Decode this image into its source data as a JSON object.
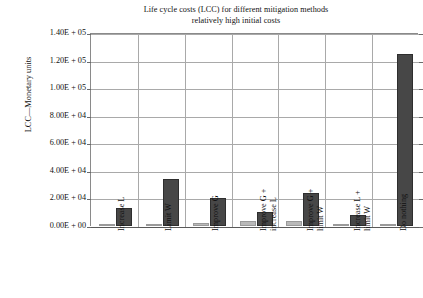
{
  "chart_data": {
    "type": "bar",
    "title": "Life cycle costs (LCC) for different mitigation methods relatively high initial costs",
    "title_line1": "Life cycle costs (LCC) for different mitigation methods",
    "title_line2": "relatively high initial costs",
    "xlabel": "",
    "ylabel": "LCC—Monetary units",
    "ylim": [
      0,
      140000
    ],
    "ytick_values": [
      0,
      20000,
      40000,
      60000,
      80000,
      100000,
      120000,
      140000
    ],
    "ytick_labels": [
      "0.00E + 00",
      "2.00E + 04",
      "4.00E + 04",
      "6.00E + 04",
      "8.00E + 04",
      "1.00E + 05",
      "1.20E + 05",
      "1.40E + 05"
    ],
    "grid": true,
    "legend": "none",
    "categories": [
      "Increase L",
      "Limit W",
      "Improve G",
      "Improve G +\nincrease L",
      "Improve G +\nlimit W",
      "Increase L +\nlimit W",
      "Do nothing"
    ],
    "series": [
      {
        "name": "initial costs",
        "color": "#b9b9b9",
        "values": [
          1500,
          1500,
          2000,
          3500,
          4000,
          1500,
          1000
        ]
      },
      {
        "name": "life cycle costs",
        "color": "#474747",
        "values": [
          13000,
          34000,
          20000,
          10000,
          24000,
          8000,
          125000
        ]
      }
    ]
  }
}
